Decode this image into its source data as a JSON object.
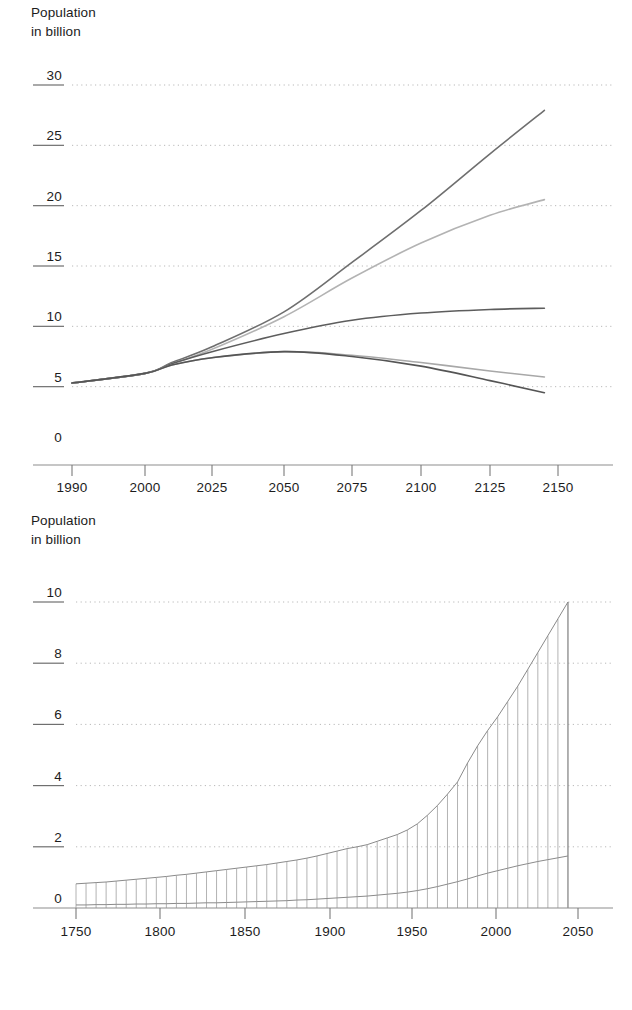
{
  "page": {
    "background": "#ffffff",
    "width": 632,
    "height": 1010
  },
  "top_chart": {
    "axis_title_line1": "Population",
    "axis_title_line2": "in billion"
  },
  "bottom_chart": {
    "axis_title_line1": "Population",
    "axis_title_line2": "in billion"
  },
  "chart_data": [
    {
      "id": "world-population-projections",
      "type": "line",
      "title": "",
      "xlabel": "",
      "ylabel": "Population in billion",
      "grid": true,
      "legend": "none",
      "xticks": [
        1990,
        2000,
        2025,
        2050,
        2075,
        2100,
        2125,
        2150
      ],
      "xtick_labels": [
        "1990",
        "2000",
        "2025",
        "2050",
        "2075",
        "2100",
        "2125",
        "2150"
      ],
      "yticks": [
        0,
        5,
        10,
        15,
        20,
        25,
        30
      ],
      "ytick_labels": [
        "0",
        "5",
        "10",
        "15",
        "20",
        "25",
        "30"
      ],
      "ylim": [
        0,
        30
      ],
      "xlim": [
        1990,
        2150
      ],
      "x": [
        1990,
        2000,
        2010,
        2025,
        2050,
        2075,
        2100,
        2125,
        2145
      ],
      "series": [
        {
          "name": "high-variant",
          "color": "#6f6f6f",
          "values": [
            5.3,
            6.1,
            7.0,
            8.3,
            11.2,
            15.3,
            19.6,
            24.3,
            27.9
          ]
        },
        {
          "name": "high-medium-variant",
          "color": "#b3b3b3",
          "values": [
            5.3,
            6.1,
            6.9,
            8.1,
            10.8,
            14.0,
            16.9,
            19.2,
            20.5
          ]
        },
        {
          "name": "medium-variant",
          "color": "#5d5d5d",
          "values": [
            5.3,
            6.1,
            6.9,
            7.9,
            9.4,
            10.5,
            11.1,
            11.4,
            11.5
          ]
        },
        {
          "name": "low-medium-variant",
          "color": "#a8a8a8",
          "values": [
            5.3,
            6.1,
            6.8,
            7.4,
            7.9,
            7.6,
            7.0,
            6.3,
            5.8
          ]
        },
        {
          "name": "low-variant",
          "color": "#555555",
          "values": [
            5.3,
            6.1,
            6.8,
            7.4,
            7.9,
            7.5,
            6.7,
            5.5,
            4.5
          ]
        }
      ]
    },
    {
      "id": "historical-world-population",
      "type": "bar",
      "title": "",
      "xlabel": "",
      "ylabel": "Population in billion",
      "grid": true,
      "legend": "none",
      "xticks": [
        1750,
        1800,
        1850,
        1900,
        1950,
        2000,
        2050
      ],
      "xtick_labels": [
        "1750",
        "1800",
        "1850",
        "1900",
        "1950",
        "2000",
        "2050"
      ],
      "yticks": [
        0,
        2,
        4,
        6,
        8,
        10
      ],
      "ytick_labels": [
        "0",
        "2",
        "4",
        "6",
        "8",
        "10"
      ],
      "ylim": [
        0,
        10
      ],
      "xlim": [
        1745,
        2050
      ],
      "bar_step_years": 6,
      "categories": [
        1750,
        1756,
        1762,
        1768,
        1774,
        1780,
        1786,
        1792,
        1798,
        1804,
        1810,
        1816,
        1822,
        1828,
        1834,
        1840,
        1846,
        1852,
        1858,
        1864,
        1870,
        1876,
        1882,
        1888,
        1894,
        1900,
        1906,
        1912,
        1918,
        1924,
        1930,
        1936,
        1942,
        1948,
        1954,
        1960,
        1966,
        1972,
        1978,
        1984,
        1990,
        1996,
        2002,
        2008,
        2014,
        2020,
        2026,
        2032,
        2038,
        2044
      ],
      "series": [
        {
          "name": "total-world-population",
          "values": [
            0.79,
            0.81,
            0.83,
            0.85,
            0.88,
            0.91,
            0.94,
            0.97,
            1.0,
            1.03,
            1.07,
            1.1,
            1.14,
            1.18,
            1.22,
            1.26,
            1.3,
            1.34,
            1.38,
            1.42,
            1.47,
            1.52,
            1.57,
            1.63,
            1.7,
            1.78,
            1.86,
            1.94,
            2.0,
            2.07,
            2.18,
            2.29,
            2.4,
            2.55,
            2.75,
            3.03,
            3.35,
            3.72,
            4.12,
            4.74,
            5.3,
            5.8,
            6.25,
            6.75,
            7.25,
            7.8,
            8.35,
            8.9,
            9.45,
            10.0
          ]
        },
        {
          "name": "less-developed-baseline",
          "values": [
            0.1,
            0.1,
            0.11,
            0.11,
            0.12,
            0.12,
            0.13,
            0.13,
            0.14,
            0.14,
            0.15,
            0.15,
            0.16,
            0.17,
            0.17,
            0.18,
            0.19,
            0.2,
            0.21,
            0.22,
            0.23,
            0.24,
            0.26,
            0.27,
            0.29,
            0.31,
            0.33,
            0.35,
            0.37,
            0.39,
            0.42,
            0.45,
            0.48,
            0.52,
            0.57,
            0.63,
            0.7,
            0.78,
            0.86,
            0.95,
            1.05,
            1.14,
            1.22,
            1.3,
            1.38,
            1.45,
            1.52,
            1.58,
            1.64,
            1.7
          ]
        }
      ]
    }
  ]
}
